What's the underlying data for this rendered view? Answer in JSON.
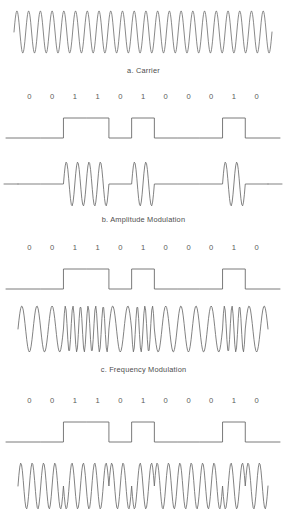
{
  "figure": {
    "line_color": "#6b6b6b",
    "text_color": "#555555",
    "background": "#ffffff"
  },
  "panels": [
    {
      "id": "carrier",
      "kind": "carrier",
      "caption": "a. Carrier",
      "description": "Unmodulated sinusoidal carrier wave, constant amplitude and constant frequency",
      "cycles": 22
    },
    {
      "id": "amplitude-modulation",
      "kind": "ask",
      "caption": "b.  Amplitude Modulation",
      "description": "Amplitude shift keying: carrier bursts present during 1 bits, flat line during 0 bits"
    },
    {
      "id": "frequency-modulation",
      "kind": "fsk",
      "caption": "c.  Frequency Modulation",
      "description": "Frequency shift keying: constant amplitude, high frequency during 1 bits, low frequency during 0 bits"
    },
    {
      "id": "phase-modulation",
      "kind": "psk",
      "description": "Phase shift keying: constant amplitude and frequency with phase reversals at bit transitions"
    }
  ],
  "bit_sequence": [
    "0",
    "0",
    "1",
    "1",
    "0",
    "1",
    "0",
    "0",
    "0",
    "1",
    "0"
  ],
  "chart_data": {
    "type": "line",
    "xlabel": "",
    "ylabel": "",
    "grid": false,
    "legend": "none",
    "bit_sequence": [
      0,
      0,
      1,
      1,
      0,
      1,
      0,
      0,
      0,
      1,
      0
    ],
    "bit_labels": [
      "0",
      "0",
      "1",
      "1",
      "0",
      "1",
      "0",
      "0",
      "0",
      "1",
      "0"
    ],
    "signal_x_start": 18,
    "signal_x_end": 268,
    "series": [
      {
        "name": "a. Carrier",
        "type": "sine",
        "amplitude": 1.0,
        "cycles": 22,
        "modulated": false
      },
      {
        "name": "Digital data (ASK panel)",
        "type": "square",
        "values": [
          0,
          0,
          1,
          1,
          0,
          1,
          0,
          0,
          0,
          1,
          0
        ]
      },
      {
        "name": "b. Amplitude Modulation",
        "type": "ask",
        "amplitude_for_one": 1.0,
        "amplitude_for_zero": 0.0,
        "cycles_per_bit": 2,
        "values": [
          0,
          0,
          1,
          1,
          0,
          1,
          0,
          0,
          0,
          1,
          0
        ]
      },
      {
        "name": "Digital data (FSK panel)",
        "type": "square",
        "values": [
          0,
          0,
          1,
          1,
          0,
          1,
          0,
          0,
          0,
          1,
          0
        ]
      },
      {
        "name": "c. Frequency Modulation",
        "type": "fsk",
        "cycles_per_bit_one": 3,
        "cycles_per_bit_zero": 1.5,
        "amplitude": 1.0,
        "values": [
          0,
          0,
          1,
          1,
          0,
          1,
          0,
          0,
          0,
          1,
          0
        ]
      },
      {
        "name": "Digital data (PSK panel)",
        "type": "square",
        "values": [
          0,
          0,
          1,
          1,
          0,
          1,
          0,
          0,
          0,
          1,
          0
        ]
      },
      {
        "name": "Phase Modulation",
        "type": "psk",
        "cycles_per_bit": 2,
        "amplitude": 1.0,
        "phase_for_one_deg": 180,
        "phase_for_zero_deg": 0,
        "values": [
          0,
          0,
          1,
          1,
          0,
          1,
          0,
          0,
          0,
          1,
          0
        ]
      }
    ]
  }
}
